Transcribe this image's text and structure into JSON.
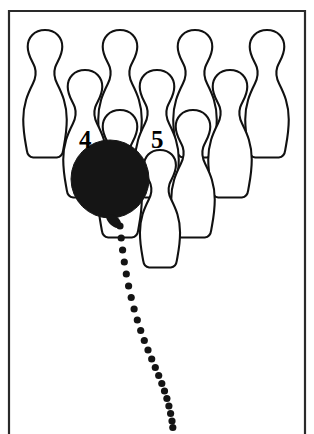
{
  "figure": {
    "background_color": "#ffffff",
    "ink_color": "#111111",
    "ball_color": "#151515",
    "frame_color": "#2a2a2a",
    "width": 314,
    "height": 434
  },
  "frame": {
    "name": "panel-border",
    "left_x": 9,
    "right_x": 305,
    "top_y": 11,
    "bottom_y": 434,
    "style": "three-sided open bottom"
  },
  "labels": [
    {
      "id": "pin-label-4",
      "text": "4",
      "x": 79,
      "y": 148
    },
    {
      "id": "pin-label-5",
      "text": "5",
      "x": 151,
      "y": 148
    }
  ],
  "ball": {
    "name": "bowling-ball",
    "center_x": 110,
    "center_y": 179,
    "radius": 39,
    "fill": "#151515"
  },
  "pins": [
    {
      "id": "pin-back-1",
      "row": "back",
      "cx": 45,
      "top_y": 30,
      "height": 128,
      "scale": 1.0
    },
    {
      "id": "pin-back-2",
      "row": "back",
      "cx": 120,
      "top_y": 30,
      "height": 128,
      "scale": 1.0
    },
    {
      "id": "pin-back-3",
      "row": "back",
      "cx": 195,
      "top_y": 30,
      "height": 128,
      "scale": 1.0
    },
    {
      "id": "pin-back-4",
      "row": "back",
      "cx": 267,
      "top_y": 30,
      "height": 128,
      "scale": 1.0
    },
    {
      "id": "pin-mid-1",
      "row": "middle",
      "cx": 85,
      "top_y": 70,
      "height": 128,
      "scale": 1.0
    },
    {
      "id": "pin-mid-2",
      "row": "middle",
      "cx": 157,
      "top_y": 70,
      "height": 128,
      "scale": 1.0
    },
    {
      "id": "pin-mid-3",
      "row": "middle",
      "cx": 230,
      "top_y": 70,
      "height": 128,
      "scale": 1.0
    },
    {
      "id": "pin-front-1",
      "row": "front",
      "cx": 120,
      "top_y": 110,
      "height": 128,
      "scale": 1.0
    },
    {
      "id": "pin-front-2",
      "row": "front",
      "cx": 193,
      "top_y": 110,
      "height": 128,
      "scale": 1.0
    },
    {
      "id": "pin-head-1",
      "row": "head",
      "cx": 160,
      "top_y": 150,
      "height": 118,
      "scale": 1.0
    }
  ],
  "trail": {
    "name": "ball-path-trail",
    "description": "dotted curved trajectory of the ball",
    "dot_radius": 3.6,
    "color": "#141414",
    "points": [
      [
        120.0,
        226.0
      ],
      [
        121.2,
        238.0
      ],
      [
        122.6,
        250.0
      ],
      [
        124.3,
        262.0
      ],
      [
        126.3,
        274.0
      ],
      [
        128.6,
        286.0
      ],
      [
        131.2,
        297.5
      ],
      [
        134.1,
        309.0
      ],
      [
        137.3,
        320.0
      ],
      [
        140.7,
        330.5
      ],
      [
        144.3,
        340.5
      ],
      [
        148.0,
        350.0
      ],
      [
        151.7,
        359.0
      ],
      [
        155.3,
        367.5
      ],
      [
        158.7,
        375.5
      ],
      [
        161.8,
        383.5
      ],
      [
        164.5,
        391.0
      ],
      [
        166.9,
        398.5
      ],
      [
        168.9,
        406.0
      ],
      [
        170.6,
        413.5
      ],
      [
        172.0,
        421.0
      ],
      [
        172.8,
        427.5
      ]
    ]
  }
}
